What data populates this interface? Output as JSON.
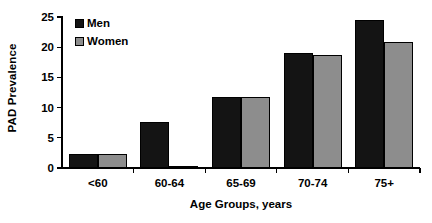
{
  "chart_data": {
    "type": "bar",
    "title": "",
    "subtitle": "",
    "xlabel": "Age Groups, years",
    "ylabel": "PAD Prevalence",
    "categories": [
      "<60",
      "60-64",
      "65-69",
      "70-74",
      "75+"
    ],
    "series": [
      {
        "name": "Men",
        "color": "#141414",
        "values": [
          2.3,
          7.6,
          11.7,
          19.0,
          24.5
        ]
      },
      {
        "name": "Women",
        "color": "#8d8d8d",
        "values": [
          2.3,
          0.4,
          11.7,
          18.7,
          20.9
        ]
      }
    ],
    "ylim": [
      0,
      25
    ],
    "yticks": [
      0,
      5,
      10,
      15,
      20,
      25
    ],
    "ytick_labels": [
      "0",
      "5",
      "10",
      "15",
      "20",
      "25"
    ],
    "grid": false,
    "legend_position": "top-left-inside",
    "legend_entries": [
      "Men",
      "Women"
    ],
    "annotations": []
  }
}
